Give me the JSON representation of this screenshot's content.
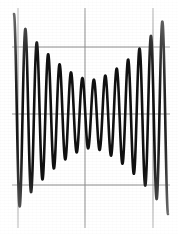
{
  "figure": {
    "kind": "scanned-oscilloscope-trace",
    "width": 178,
    "height": 234,
    "background_color": "#ffffff",
    "trace_color": "#111111",
    "grid_color": "#8c8c8c",
    "caption": ""
  },
  "grid": {
    "visible": true,
    "line_color": "#8d8d8d",
    "line_width_px": 1,
    "vertical_lines_x": [
      18,
      85,
      153
    ],
    "horizontal_lines_y": [
      47,
      114,
      185
    ],
    "vertical_extend_top_y": 8,
    "vertical_extend_bottom_y": 228,
    "horizontal_extend_left_x": 12,
    "horizontal_extend_right_x": 170
  },
  "chart_data": {
    "type": "line",
    "title": "",
    "subtitle": "",
    "xlabel": "",
    "ylabel": "",
    "xlim": [
      0,
      1
    ],
    "ylim": [
      -1.15,
      1.15
    ],
    "grid": true,
    "legend": null,
    "annotations": [],
    "xticklabels": [],
    "yticklabels": [],
    "series": [
      {
        "name": "trace",
        "color": "#111111",
        "stroke_width_px": 2.6,
        "model": "envelope_times_carrier",
        "carrier_cycles": 13.5,
        "carrier_phase_deg": 0,
        "envelope_type": "symmetric-hourglass",
        "envelope_min": 0.34,
        "envelope_max": 1.0,
        "envelope_center_x": 0.5,
        "envelope_shape_power": 1.6,
        "x_start_px": 14,
        "x_end_px": 168,
        "baseline_y_px": 114,
        "amplitude_px": 100,
        "x": [
          0.0,
          0.02,
          0.04,
          0.06,
          0.08,
          0.1,
          0.12,
          0.14,
          0.16,
          0.18,
          0.2,
          0.22,
          0.24,
          0.26,
          0.28,
          0.3,
          0.32,
          0.34,
          0.36,
          0.38,
          0.4,
          0.42,
          0.44,
          0.46,
          0.48,
          0.5,
          0.52,
          0.54,
          0.56,
          0.58,
          0.6,
          0.62,
          0.64,
          0.66,
          0.68,
          0.7,
          0.72,
          0.74,
          0.76,
          0.78,
          0.8,
          0.82,
          0.84,
          0.86,
          0.88,
          0.9,
          0.92,
          0.94,
          0.96,
          0.98,
          1.0
        ],
        "envelope": [
          1.0,
          0.97,
          0.93,
          0.89,
          0.85,
          0.81,
          0.77,
          0.73,
          0.69,
          0.65,
          0.62,
          0.58,
          0.55,
          0.52,
          0.49,
          0.46,
          0.44,
          0.41,
          0.39,
          0.38,
          0.36,
          0.35,
          0.35,
          0.34,
          0.34,
          0.34,
          0.34,
          0.34,
          0.35,
          0.35,
          0.36,
          0.38,
          0.39,
          0.41,
          0.44,
          0.46,
          0.49,
          0.52,
          0.55,
          0.58,
          0.62,
          0.65,
          0.69,
          0.73,
          0.77,
          0.81,
          0.85,
          0.89,
          0.93,
          0.97,
          1.0
        ],
        "peak_amplitudes_left_to_right": [
          1.0,
          0.95,
          0.87,
          0.79,
          0.71,
          0.63,
          0.55,
          0.48,
          0.42,
          0.38,
          0.35,
          0.34,
          0.35,
          0.38,
          0.42,
          0.48,
          0.55,
          0.63,
          0.71,
          0.79,
          0.87,
          0.95,
          1.0
        ]
      }
    ]
  }
}
